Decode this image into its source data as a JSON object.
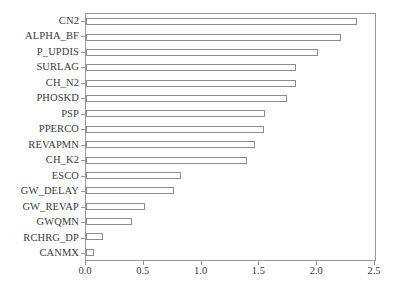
{
  "chart_data": {
    "type": "bar",
    "orientation": "horizontal",
    "title": "",
    "xlabel": "",
    "ylabel": "",
    "xlim": [
      0.0,
      2.5
    ],
    "xticks": [
      "0.0",
      "0.5",
      "1.0",
      "1.5",
      "2.0",
      "2.5"
    ],
    "xtick_values": [
      0.0,
      0.5,
      1.0,
      1.5,
      2.0,
      2.5
    ],
    "grid": false,
    "legend": false,
    "bar_fill_color": "#ffffff",
    "bar_edge_color": "#8d8d8d",
    "axis_color": "#9a9a9a",
    "categories": [
      "CN2",
      "ALPHA_BF",
      "P_UPDIS",
      "SURLAG",
      "CH_N2",
      "PHOSKD",
      "PSP",
      "PPERCO",
      "REVAPMN",
      "CH_K2",
      "ESCO",
      "GW_DELAY",
      "GW_REVAP",
      "GWQMN",
      "RCHRG_DP",
      "CANMX"
    ],
    "values": [
      2.34,
      2.21,
      2.01,
      1.82,
      1.82,
      1.74,
      1.55,
      1.54,
      1.46,
      1.39,
      0.82,
      0.76,
      0.51,
      0.4,
      0.15,
      0.07
    ]
  }
}
